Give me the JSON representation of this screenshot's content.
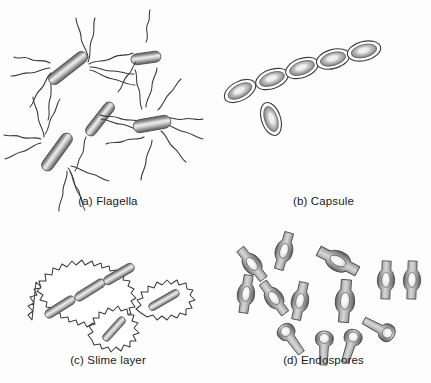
{
  "figure": {
    "background_color": "#fdfdfd",
    "ink_color": "#3a3a3a",
    "cell_dark": "#6f6f6f",
    "cell_light": "#f2f2f2",
    "caption_color": "#1a1a1a"
  },
  "panels": [
    {
      "id": "a",
      "caption": "(a) Flagella",
      "subject": "bacterial-flagella-arrangements",
      "cells": [
        {
          "name": "amphitrichous-cell-upper-left",
          "arrangement": "amphitrichous",
          "cx": 68,
          "cy": 68,
          "length": 46,
          "width": 12,
          "angle": -38,
          "flagella_count": 9
        },
        {
          "name": "monotrichous-cell-top-right",
          "arrangement": "monotrichous",
          "cx": 145,
          "cy": 52,
          "length": 30,
          "width": 11,
          "angle": -8,
          "flagella_count": 1
        },
        {
          "name": "peritrichous-cell-right",
          "arrangement": "peritrichous",
          "cx": 152,
          "cy": 118,
          "length": 38,
          "width": 13,
          "angle": -10,
          "flagella_count": 10
        },
        {
          "name": "atrichous-cell-center",
          "arrangement": "none-visible",
          "cx": 100,
          "cy": 113,
          "length": 40,
          "width": 11,
          "angle": -52,
          "flagella_count": 2
        },
        {
          "name": "amphitrichous-cell-lower-left",
          "arrangement": "amphitrichous",
          "cx": 57,
          "cy": 146,
          "length": 44,
          "width": 12,
          "angle": -54,
          "flagella_count": 8
        }
      ]
    },
    {
      "id": "b",
      "caption": "(b) Capsule",
      "subject": "encapsulated-cells",
      "chain_length": 4,
      "solitary_count": 2,
      "cells": [
        {
          "name": "capsule-chain-cell-1",
          "cx": 19,
          "cy": 57,
          "length": 31,
          "width": 15,
          "angle": -20
        },
        {
          "name": "capsule-chain-cell-2",
          "cx": 45,
          "cy": 48,
          "length": 31,
          "width": 15,
          "angle": -20
        },
        {
          "name": "capsule-chain-cell-3",
          "cx": 70,
          "cy": 40,
          "length": 31,
          "width": 15,
          "angle": -16
        },
        {
          "name": "capsule-chain-cell-4",
          "cx": 96,
          "cy": 33,
          "length": 31,
          "width": 15,
          "angle": -14
        },
        {
          "name": "capsule-solitary-cell-left",
          "cx": -52,
          "cy": 58,
          "length": 30,
          "width": 15,
          "angle": -28
        },
        {
          "name": "capsule-solitary-cell-lower",
          "cx": -22,
          "cy": 85,
          "length": 30,
          "width": 15,
          "angle": 72
        }
      ]
    },
    {
      "id": "c",
      "caption": "(c) Slime layer",
      "subject": "slime-layer-envelopes",
      "groups": [
        {
          "name": "slime-chain-three-cells",
          "cells": 3
        },
        {
          "name": "slime-solitary-lower",
          "cells": 1
        },
        {
          "name": "slime-solitary-right",
          "cells": 1
        }
      ]
    },
    {
      "id": "d",
      "caption": "(d) Endospores",
      "subject": "endospore-positions",
      "central_count": 8,
      "terminal_count": 4,
      "spores": [
        {
          "name": "endospore-central-1",
          "type": "central",
          "cx": 36,
          "cy": 46,
          "angle": -38
        },
        {
          "name": "endospore-central-2",
          "type": "central",
          "cx": 66,
          "cy": 33,
          "angle": 18
        },
        {
          "name": "endospore-central-3",
          "type": "central",
          "cx": 32,
          "cy": 76,
          "angle": 10
        },
        {
          "name": "endospore-central-4",
          "type": "central",
          "cx": 58,
          "cy": 80,
          "angle": -35
        },
        {
          "name": "endospore-central-5",
          "type": "central",
          "cx": 83,
          "cy": 84,
          "angle": 14
        },
        {
          "name": "endospore-central-6",
          "type": "central",
          "cx": 120,
          "cy": 42,
          "angle": -30
        },
        {
          "name": "endospore-central-7",
          "type": "central",
          "cx": 129,
          "cy": 82,
          "angle": 4
        },
        {
          "name": "endospore-central-8",
          "type": "central",
          "cx": 168,
          "cy": 62,
          "angle": 2
        },
        {
          "name": "endospore-central-9",
          "type": "central",
          "cx": 192,
          "cy": 62,
          "angle": 2
        },
        {
          "name": "endospore-terminal-1",
          "type": "terminal",
          "cx": 78,
          "cy": 122,
          "angle": -34
        },
        {
          "name": "endospore-terminal-2",
          "type": "terminal",
          "cx": 108,
          "cy": 130,
          "angle": -80
        },
        {
          "name": "endospore-terminal-3",
          "type": "terminal",
          "cx": 133,
          "cy": 128,
          "angle": -70
        },
        {
          "name": "endospore-terminal-4",
          "type": "terminal",
          "cx": 160,
          "cy": 110,
          "angle": 150
        }
      ]
    }
  ]
}
